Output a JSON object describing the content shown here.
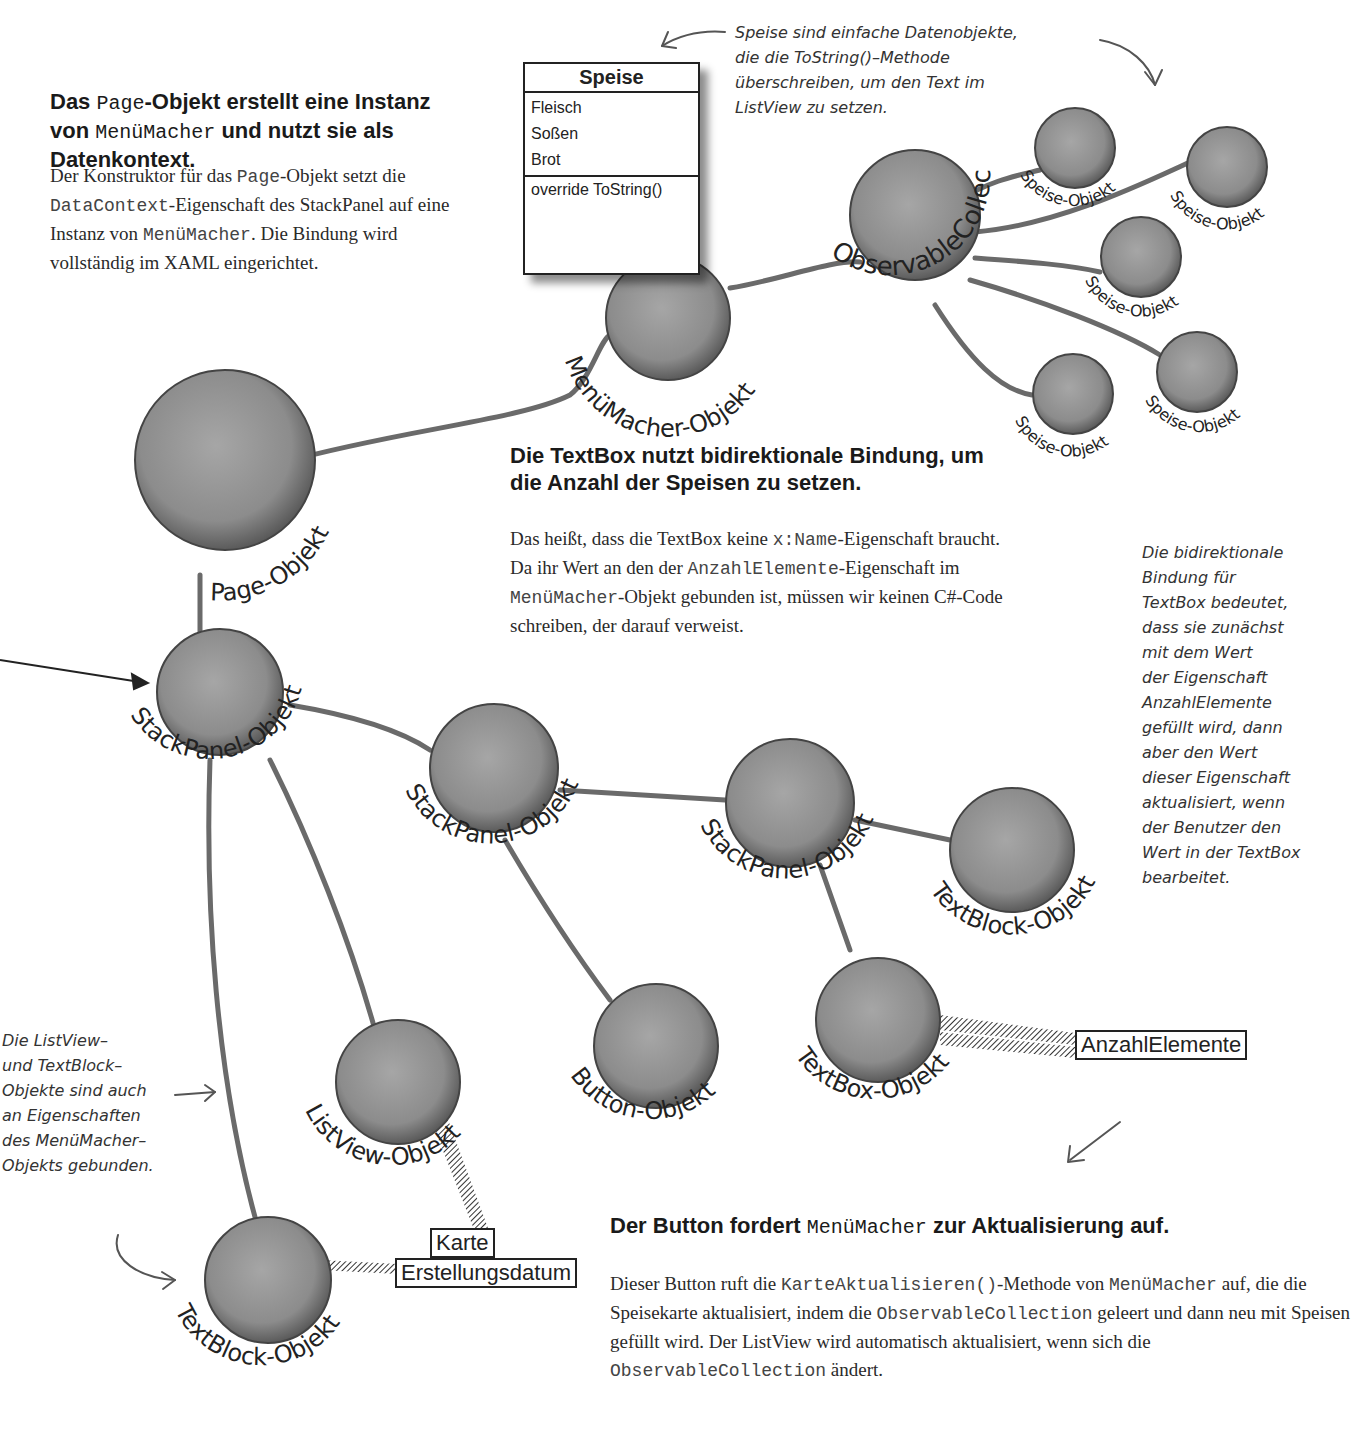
{
  "sections": {
    "page_object": {
      "heading_parts": [
        "Das ",
        "Page",
        "-Objekt erstellt eine Instanz von ",
        "MenüMacher",
        " und nutzt sie als Datenkontext."
      ],
      "body_parts": [
        "Der Konstruktor für das ",
        "Page",
        "-Objekt setzt die ",
        "DataContext",
        "-Eigenschaft des StackPanel auf eine Instanz von ",
        "MenüMacher",
        ". Die Bindung wird vollständig im XAML eingerichtet."
      ]
    },
    "textbox": {
      "heading": "Die TextBox nutzt bidirektionale Bindung, um die Anzahl der Speisen zu setzen.",
      "body_parts": [
        "Das heißt, dass die TextBox keine ",
        "x:Name",
        "-Eigenschaft braucht. Da ihr Wert an den der ",
        "AnzahlElemente",
        "-Eigenschaft im ",
        "MenüMacher",
        "-Objekt gebunden ist, müssen wir keinen C#-Code schreiben, der darauf verweist."
      ]
    },
    "button": {
      "heading_parts": [
        "Der Button fordert ",
        "MenüMacher",
        " zur Aktualisierung auf."
      ],
      "body_parts": [
        "Dieser Button ruft die ",
        "KarteAktualisieren()",
        "-Methode von ",
        "MenüMacher",
        " auf, die die Speisekarte aktualisiert, indem die ",
        "ObservableCollection",
        " geleert und dann neu mit Speisen gefüllt wird. Der ListView wird automatisch aktualisiert, wenn sich die ",
        "ObservableCollection",
        " ändert."
      ]
    }
  },
  "annotations": {
    "speise": "Speise sind einfache Datenobjekte, die die ToString()-Methode überschreiben, um den Text im ListView zu setzen.",
    "speise_lines": [
      "Speise sind einfache Datenobjekte,",
      "die die ToString()–Methode",
      "überschreiben, um den Text im",
      "ListView zu setzen."
    ],
    "bidirectional_lines": [
      "Die bidirektionale",
      "Bindung für",
      "TextBox bedeutet,",
      "dass sie zunächst",
      "mit dem Wert",
      "der Eigenschaft",
      "AnzahlElemente",
      "gefüllt wird, dann",
      "aber den Wert",
      "dieser Eigenschaft",
      "aktualisiert, wenn",
      "der Benutzer den",
      "Wert in der TextBox",
      "bearbeitet."
    ],
    "listview_lines": [
      "Die ListView–",
      "und TextBlock–",
      "Objekte sind auch",
      "an Eigenschaften",
      "des MenüMacher–",
      "Objekts gebunden."
    ]
  },
  "uml": {
    "class_name": "Speise",
    "attributes": [
      "Fleisch",
      "Soßen",
      "Brot"
    ],
    "methods": [
      "override ToString()"
    ]
  },
  "nodes": {
    "page": "Page-Objekt",
    "menumacher": "MenüMacher-Objekt",
    "observable": "ObservableCollection",
    "speise": "Speise-Objekt",
    "stackpanel": "StackPanel-Objekt",
    "listview": "ListView-Objekt",
    "button": "Button-Objekt",
    "textblock": "TextBlock-Objekt",
    "textbox": "TextBox-Objekt"
  },
  "properties": {
    "karte": "Karte",
    "erstellungsdatum": "Erstellungsdatum",
    "anzahl": "AnzahlElemente"
  },
  "colors": {
    "sphere": "#8a8a8a",
    "edge": "#6a6a6a",
    "text": "#222222"
  }
}
